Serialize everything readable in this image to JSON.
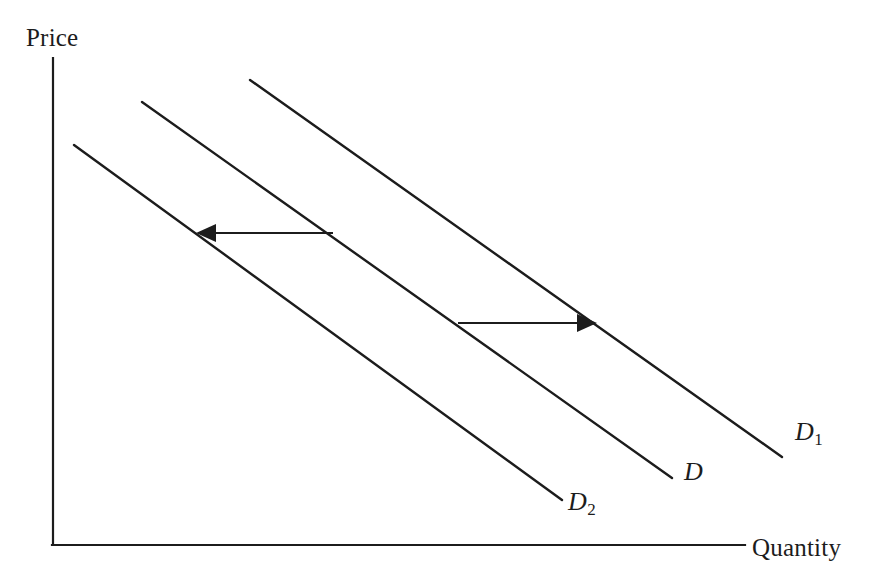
{
  "figure": {
    "type": "economics-demand-shift-diagram",
    "background_color": "#ffffff",
    "line_color": "#1c1c1c"
  },
  "axes": {
    "y_label": "Price",
    "x_label": "Quantity",
    "origin": {
      "x": 53,
      "y": 545
    },
    "y_axis_top": {
      "x": 53,
      "y": 58
    },
    "x_axis_right": {
      "x": 745,
      "y": 545
    }
  },
  "curves": [
    {
      "id": "d1",
      "label": "D",
      "subscript": "1",
      "description": "rightward-shifted demand curve",
      "x1": 250,
      "y1": 80,
      "x2": 782,
      "y2": 457
    },
    {
      "id": "d",
      "label": "D",
      "subscript": "",
      "description": "original demand curve",
      "x1": 142,
      "y1": 102,
      "x2": 672,
      "y2": 478
    },
    {
      "id": "d2",
      "label": "D",
      "subscript": "2",
      "description": "leftward-shifted demand curve",
      "x1": 74,
      "y1": 145,
      "x2": 562,
      "y2": 500
    }
  ],
  "arrows": [
    {
      "id": "leftward-shift-arrow",
      "direction": "left",
      "description": "decrease in demand from D to D2",
      "tail_x": 333,
      "tail_y": 233,
      "head_x": 196,
      "head_y": 233
    },
    {
      "id": "rightward-shift-arrow",
      "direction": "right",
      "description": "increase in demand from D to D1",
      "tail_x": 458,
      "tail_y": 323,
      "head_x": 597,
      "head_y": 323
    }
  ]
}
